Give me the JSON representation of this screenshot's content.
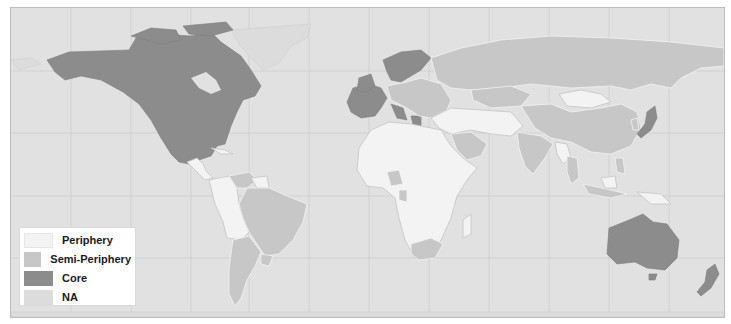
{
  "map": {
    "title": "",
    "projection": "Miller cylindrical world map",
    "ocean_color": "#e1e1e1",
    "classes": {
      "core": [
        "United States",
        "Canada",
        "Mexico",
        "United Kingdom",
        "Ireland",
        "France",
        "Spain",
        "Portugal",
        "Germany",
        "Italy",
        "Greece",
        "Norway",
        "Sweden",
        "Finland",
        "Denmark",
        "Netherlands",
        "Belgium",
        "Austria",
        "Switzerland",
        "Japan",
        "Australia",
        "New Zealand"
      ],
      "semi_periphery": [
        "Russia",
        "China",
        "India",
        "Brazil",
        "Argentina",
        "Venezuela",
        "Uruguay",
        "South Africa",
        "Nigeria",
        "Gabon",
        "Saudi Arabia",
        "Kazakhstan",
        "Turkey",
        "Poland",
        "Ukraine",
        "Thailand",
        "Malaysia",
        "Indonesia",
        "Philippines",
        "South Korea"
      ],
      "periphery": [
        "Mongolia",
        "Africa (most countries)",
        "Central America",
        "Colombia",
        "Ecuador",
        "Peru",
        "Bolivia",
        "Paraguay",
        "Guyana",
        "Suriname",
        "Middle East (most)",
        "Central Asia",
        "Myanmar",
        "Laos",
        "Cambodia",
        "Papua New Guinea"
      ],
      "na": [
        "Greenland",
        "Antarctica",
        "Small islands"
      ]
    }
  },
  "legend": {
    "items": [
      {
        "label": "Periphery",
        "color": "#f3f3f3"
      },
      {
        "label": "Semi-Periphery",
        "color": "#c7c7c7"
      },
      {
        "label": "Core",
        "color": "#8c8c8c"
      },
      {
        "label": "NA",
        "color": "#dcdcdc"
      }
    ]
  }
}
